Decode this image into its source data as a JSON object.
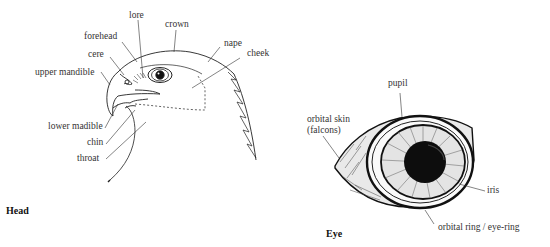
{
  "head": {
    "title": "Head",
    "labels": {
      "lore": "lore",
      "crown": "crown",
      "forehead": "forehead",
      "nape": "nape",
      "cheek": "cheek",
      "cere": "cere",
      "upper_mandible": "upper mandible",
      "lower_mandible": "lower madible",
      "chin": "chin",
      "throat": "throat"
    }
  },
  "eye": {
    "title": "Eye",
    "labels": {
      "pupil": "pupil",
      "orbital_skin_line1": "orbital skin",
      "orbital_skin_line2": "(falcons)",
      "iris": "iris",
      "orbital_ring": "orbital ring / eye-ring"
    }
  }
}
